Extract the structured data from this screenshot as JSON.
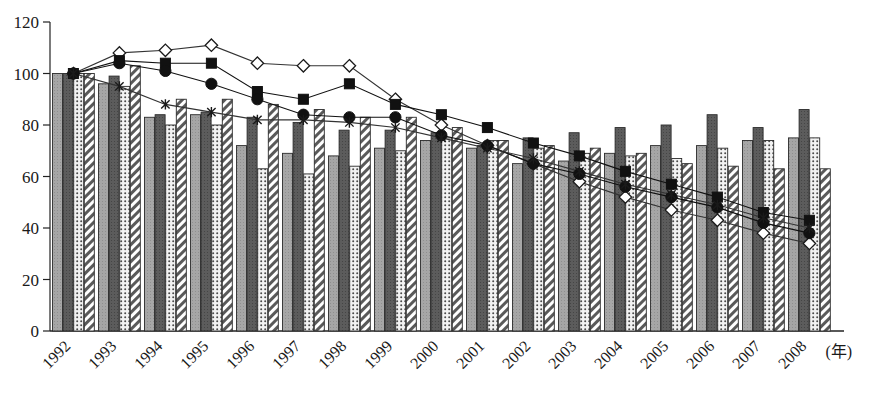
{
  "chart_data": {
    "type": "bar",
    "title": "",
    "subtitle": "",
    "xlabel": "(年)",
    "ylabel": "",
    "ylim": [
      0,
      120
    ],
    "yticks": [
      0,
      20,
      40,
      60,
      80,
      100,
      120
    ],
    "grid": false,
    "legend_position": "none",
    "categories": [
      "1992",
      "1993",
      "1994",
      "1995",
      "1996",
      "1997",
      "1998",
      "1999",
      "2000",
      "2001",
      "2002",
      "2003",
      "2004",
      "2005",
      "2006",
      "2007",
      "2008"
    ],
    "bar_series": [
      {
        "name": "bar-light-gray",
        "pattern": "solid-light-gray",
        "color": "#9a9a9a",
        "values": [
          100,
          96,
          83,
          84,
          72,
          69,
          68,
          71,
          74,
          71,
          65,
          66,
          69,
          72,
          72,
          74,
          75
        ]
      },
      {
        "name": "bar-dark-gray",
        "pattern": "solid-dark-gray",
        "color": "#545454",
        "values": [
          100,
          99,
          84,
          85,
          83,
          81,
          78,
          78,
          77,
          72,
          75,
          77,
          79,
          80,
          84,
          79,
          86
        ]
      },
      {
        "name": "bar-dotted",
        "pattern": "dotted-stipple",
        "color": "#d8d8d8",
        "values": [
          100,
          95,
          80,
          80,
          63,
          61,
          64,
          70,
          75,
          74,
          71,
          69,
          68,
          67,
          71,
          74,
          75
        ]
      },
      {
        "name": "bar-hatched",
        "pattern": "diagonal-hatch",
        "color": "#ffffff",
        "values": [
          100,
          103,
          90,
          90,
          88,
          86,
          83,
          83,
          79,
          74,
          72,
          71,
          69,
          65,
          64,
          63,
          63
        ]
      }
    ],
    "line_series": [
      {
        "name": "line-open-diamond",
        "marker": "open-diamond",
        "color": "#333333",
        "values": [
          100,
          108,
          109,
          111,
          104,
          103,
          103,
          90,
          80,
          72,
          65,
          58,
          52,
          47,
          43,
          38,
          34
        ]
      },
      {
        "name": "line-filled-square",
        "marker": "filled-square",
        "color": "#111111",
        "values": [
          100,
          105,
          104,
          104,
          93,
          90,
          96,
          88,
          84,
          79,
          73,
          68,
          62,
          57,
          52,
          46,
          43
        ]
      },
      {
        "name": "line-filled-circle",
        "marker": "filled-circle",
        "color": "#111111",
        "values": [
          100,
          104,
          101,
          96,
          90,
          84,
          83,
          83,
          76,
          72,
          65,
          61,
          56,
          52,
          48,
          42,
          38
        ]
      },
      {
        "name": "line-cross",
        "marker": "cross",
        "color": "#333333",
        "values": [
          100,
          95,
          88,
          85,
          82,
          82,
          81,
          79,
          75,
          71,
          67,
          62,
          57,
          53,
          49,
          44,
          40
        ]
      }
    ]
  }
}
